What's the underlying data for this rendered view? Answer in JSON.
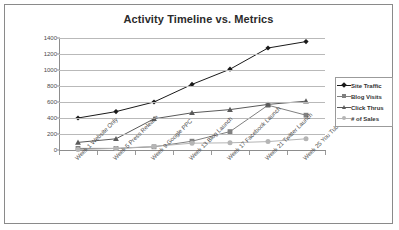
{
  "chart_data": {
    "type": "line",
    "title": "Activity Timeline vs. Metrics",
    "xlabel": "",
    "ylabel": "",
    "ylim": [
      0,
      1400
    ],
    "ytick_step": 200,
    "yticks": [
      0,
      200,
      400,
      600,
      800,
      1000,
      1200,
      1400
    ],
    "grid": true,
    "legend_position": "right",
    "categories": [
      "Week 1 Website Only",
      "Week 5 Press Release",
      "Week 9 Google PPC",
      "Week 13 Blog Launch",
      "Week 17 Facebook Launch",
      "Week 21 Twitter Launch",
      "Week 25 You Tube Uploads"
    ],
    "series": [
      {
        "name": "Site Traffic",
        "marker": "diamond",
        "color": "#1a1a1a",
        "values": [
          400,
          480,
          600,
          820,
          1010,
          1275,
          1355
        ]
      },
      {
        "name": "Blog Visits",
        "marker": "square",
        "color": "#808080",
        "values": [
          20,
          20,
          40,
          110,
          230,
          560,
          435
        ]
      },
      {
        "name": "Click Thrus",
        "marker": "triangle",
        "color": "#5a5a5a",
        "values": [
          95,
          140,
          390,
          465,
          505,
          570,
          610
        ]
      },
      {
        "name": "# of Sales",
        "marker": "circle",
        "color": "#b5b5b5",
        "values": [
          5,
          20,
          45,
          85,
          90,
          105,
          140
        ]
      }
    ]
  },
  "colors": {
    "frame_border": "#8a8a8a",
    "gridline": "#b9b9b9",
    "axis": "#8d8d8d",
    "title_text": "#2b2b2b",
    "tick_text": "#4a4a4a",
    "background": "#ffffff"
  }
}
